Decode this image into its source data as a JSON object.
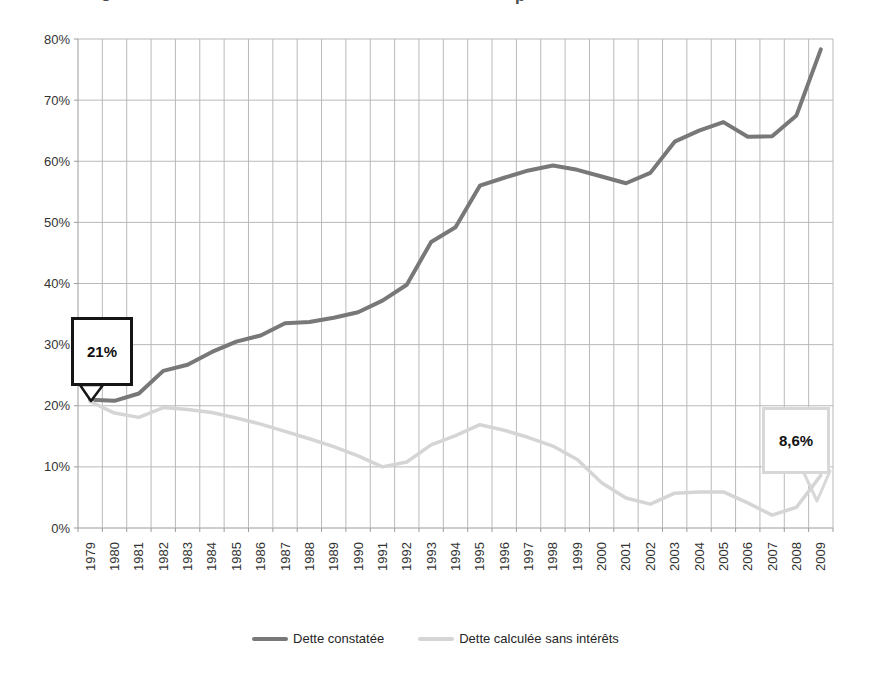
{
  "cropped_title": {
    "left_fragment": "g",
    "right_fragment": "p"
  },
  "chart_data": {
    "type": "line",
    "title": "",
    "categories": [
      "1979",
      "1980",
      "1981",
      "1982",
      "1983",
      "1984",
      "1985",
      "1986",
      "1987",
      "1988",
      "1989",
      "1990",
      "1991",
      "1992",
      "1993",
      "1994",
      "1995",
      "1996",
      "1997",
      "1998",
      "1999",
      "2000",
      "2001",
      "2002",
      "2003",
      "2004",
      "2005",
      "2006",
      "2007",
      "2008",
      "2009"
    ],
    "xlabel": "",
    "ylabel": "",
    "ylim": [
      0,
      80
    ],
    "grid": true,
    "legend_position": "bottom",
    "y_axis": {
      "min": 0,
      "max": 80,
      "step": 10,
      "tick_labels": [
        "0%",
        "10%",
        "20%",
        "30%",
        "40%",
        "50%",
        "60%",
        "70%",
        "80%"
      ]
    },
    "series": [
      {
        "name": "Dette constatée",
        "color": "#787878",
        "stroke_width": 4,
        "values": [
          21,
          20.8,
          22,
          25.7,
          26.7,
          28.8,
          30.5,
          31.5,
          33.5,
          33.7,
          34.4,
          35.3,
          37.2,
          39.8,
          46.8,
          49.2,
          56,
          57.3,
          58.5,
          59.3,
          58.6,
          57.5,
          56.4,
          58.1,
          63.2,
          65,
          66.4,
          64,
          64.1,
          67.5,
          78.3
        ]
      },
      {
        "name": "Dette calculée sans intérêts",
        "color": "#d5d5d5",
        "stroke_width": 3.5,
        "values": [
          20.7,
          18.8,
          18.1,
          19.7,
          19.4,
          18.9,
          18,
          17,
          15.8,
          14.6,
          13.3,
          11.8,
          10,
          10.8,
          13.6,
          15.1,
          16.9,
          16,
          14.8,
          13.4,
          11.2,
          7.4,
          4.9,
          3.9,
          5.7,
          5.9,
          5.9,
          4.1,
          2.1,
          3.4,
          8.6
        ]
      }
    ],
    "annotations": [
      {
        "text": "21%",
        "target_series": "Dette constatée",
        "target_year": "1979"
      },
      {
        "text": "8,6%",
        "target_series": "Dette calculée sans intérêts",
        "target_year": "2009"
      }
    ]
  },
  "colors": {
    "grid": "#b9b9b9",
    "axis": "#9b9b9b",
    "tick_text": "#333333",
    "callout_dark_border": "#151515",
    "callout_light_border": "#d8d8d8",
    "background": "#ffffff"
  }
}
